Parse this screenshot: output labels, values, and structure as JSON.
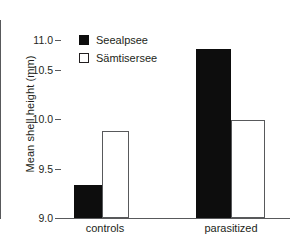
{
  "chart_data": {
    "type": "bar",
    "title": "",
    "xlabel": "",
    "ylabel": "Mean shell height (mm)",
    "categories": [
      "controls",
      "parasitized"
    ],
    "series": [
      {
        "name": "Seealpsee",
        "style": "filled",
        "color": "#0d0d0d",
        "values": [
          9.33,
          10.71
        ]
      },
      {
        "name": "Sämtisersee",
        "style": "open",
        "color": "#ffffff",
        "values": [
          9.88,
          9.99
        ]
      }
    ],
    "ylim": [
      9.0,
      11.0
    ],
    "yticks": [
      "9.0",
      "9.5",
      "10.0",
      "10.5",
      "11.0"
    ],
    "ytick_values": [
      9.0,
      9.5,
      10.0,
      10.5,
      11.0
    ],
    "grid": false,
    "legend_position": "top-left",
    "axis_color": "#58595b",
    "text_color": "#231f20"
  },
  "legend": {
    "items": [
      {
        "label": "Seealpsee",
        "style": "filled"
      },
      {
        "label": "Sämtisersee",
        "style": "open"
      }
    ]
  }
}
